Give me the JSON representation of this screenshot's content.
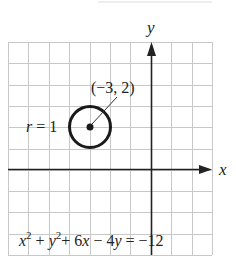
{
  "figure": {
    "type": "coordinate-plane-circle",
    "axes": {
      "x_label": "x",
      "y_label": "y",
      "x_range": [
        -7,
        3
      ],
      "y_range": [
        -4,
        6
      ],
      "grid": true
    },
    "circle": {
      "center": [
        -3,
        2
      ],
      "radius": 1,
      "center_label": "(−3, 2)",
      "radius_label_var": "r",
      "radius_label_eq": " = 1"
    },
    "equation": {
      "x_var": "x",
      "x_exp": "2",
      "plus1": " + ",
      "y_var": "y",
      "y_exp": "2",
      "rest_a": "+ 6",
      "x_var2": "x",
      "rest_b": " − 4",
      "y_var2": "y",
      "rest_c": " = −12"
    },
    "colors": {
      "grid": "#c8c8c8",
      "axis": "#222222",
      "ink": "#1a1a1a",
      "background": "#ffffff"
    }
  }
}
